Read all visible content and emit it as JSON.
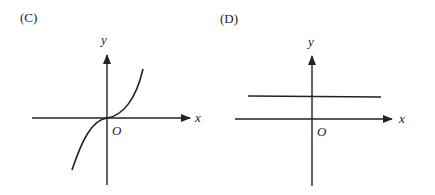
{
  "panels": [
    {
      "label": "(C)",
      "x_axis_label": "x",
      "y_axis_label": "y",
      "origin_label": "O",
      "graph": "cubic curve y = kx^3 through origin, increasing"
    },
    {
      "label": "(D)",
      "x_axis_label": "x",
      "y_axis_label": "y",
      "origin_label": "O",
      "graph": "horizontal line y = c above x-axis"
    }
  ],
  "colors": {
    "stroke": "#222222",
    "background": "#ffffff"
  }
}
